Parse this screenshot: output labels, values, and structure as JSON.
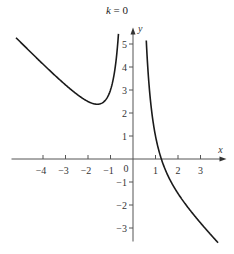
{
  "chart_data": {
    "type": "line",
    "title": "k = 0",
    "title_var": "k",
    "title_rest": " = 0",
    "xlabel": "x",
    "ylabel": "y",
    "xlim": [
      -5.4,
      3.8
    ],
    "ylim": [
      -3.5,
      5.5
    ],
    "x_ticks": [
      -4,
      -3,
      -2,
      -1,
      1,
      2,
      3
    ],
    "y_ticks": [
      -3,
      -2,
      -1,
      1,
      2,
      3,
      4,
      5
    ],
    "origin_label": "0",
    "grid": false,
    "legend": null,
    "function": "y = -x + 2/x^2",
    "vertical_asymptote": 0,
    "series": [
      {
        "name": "left branch",
        "x": [
          -5.2,
          -4.0,
          -3.0,
          -2.0,
          -1.59,
          -1.2,
          -0.9,
          -0.67
        ],
        "y": [
          5.27,
          4.13,
          3.22,
          2.5,
          2.38,
          2.59,
          3.37,
          5.12
        ]
      },
      {
        "name": "right branch",
        "x": [
          0.6,
          0.8,
          1.0,
          1.26,
          1.5,
          2.0,
          2.5,
          3.0,
          3.78
        ],
        "y": [
          4.96,
          2.33,
          1.0,
          0.0,
          -0.61,
          -1.5,
          -2.18,
          -2.78,
          -3.64
        ]
      }
    ],
    "annotations": {
      "minimum_point": {
        "x": -1.59,
        "y": 2.38
      },
      "x_intercept": 1.26
    }
  }
}
